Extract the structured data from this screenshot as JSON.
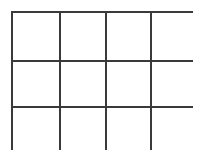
{
  "figure": {
    "background_color": "#ffffff"
  },
  "chart_data": {
    "type": "table",
    "title": "",
    "subtitle": "",
    "xlabel": "",
    "ylabel": "",
    "columns": 4,
    "rows": 3,
    "cell_count": 12,
    "column_headers": [
      "",
      "",
      "",
      ""
    ],
    "row_headers": [
      "",
      "",
      ""
    ],
    "cells": [
      [
        "",
        "",
        "",
        ""
      ],
      [
        "",
        "",
        "",
        ""
      ],
      [
        "",
        "",
        "",
        ""
      ]
    ],
    "legend": [],
    "annotations": [],
    "grid": true
  },
  "grid": {
    "columns": 4,
    "rows": 3,
    "line_color": "#3a3a3a",
    "line_width_px": 2,
    "cell_fill": "#ffffff",
    "left_px": 11,
    "top_px": 11,
    "width_px": 182,
    "height_px": 139,
    "column_edges_px": [
      11,
      57,
      103,
      148,
      193
    ],
    "row_edges_px": [
      11,
      58,
      104,
      150
    ],
    "cells": [
      {
        "id": "cell-r1c1",
        "row": 1,
        "col": 1,
        "label": ""
      },
      {
        "id": "cell-r1c2",
        "row": 1,
        "col": 2,
        "label": ""
      },
      {
        "id": "cell-r1c3",
        "row": 1,
        "col": 3,
        "label": ""
      },
      {
        "id": "cell-r1c4",
        "row": 1,
        "col": 4,
        "label": ""
      },
      {
        "id": "cell-r2c1",
        "row": 2,
        "col": 1,
        "label": ""
      },
      {
        "id": "cell-r2c2",
        "row": 2,
        "col": 2,
        "label": ""
      },
      {
        "id": "cell-r2c3",
        "row": 2,
        "col": 3,
        "label": ""
      },
      {
        "id": "cell-r2c4",
        "row": 2,
        "col": 4,
        "label": ""
      },
      {
        "id": "cell-r3c1",
        "row": 3,
        "col": 1,
        "label": ""
      },
      {
        "id": "cell-r3c2",
        "row": 3,
        "col": 2,
        "label": ""
      },
      {
        "id": "cell-r3c3",
        "row": 3,
        "col": 3,
        "label": ""
      },
      {
        "id": "cell-r3c4",
        "row": 3,
        "col": 4,
        "label": ""
      }
    ]
  }
}
